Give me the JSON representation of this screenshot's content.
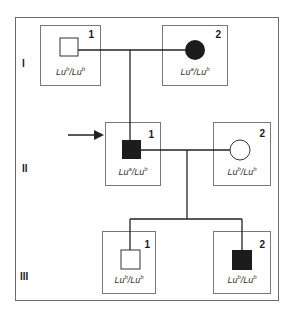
{
  "generations": [
    {
      "label": "I"
    },
    {
      "label": "II"
    },
    {
      "label": "III"
    }
  ],
  "individuals": {
    "I1": {
      "number": "1",
      "sex": "male",
      "affected": false,
      "genotype": {
        "a1": "Lu",
        "s1": "b",
        "a2": "Lu",
        "s2": "b"
      }
    },
    "I2": {
      "number": "2",
      "sex": "female",
      "affected": true,
      "genotype": {
        "a1": "Lu",
        "s1": "a",
        "a2": "Lu",
        "s2": "b"
      }
    },
    "II1": {
      "number": "1",
      "sex": "male",
      "affected": true,
      "proband": true,
      "genotype": {
        "a1": "Lu",
        "s1": "a",
        "a2": "Lu",
        "s2": "b"
      }
    },
    "II2": {
      "number": "2",
      "sex": "female",
      "affected": false,
      "genotype": {
        "a1": "Lu",
        "s1": "b",
        "a2": "Lu",
        "s2": "b"
      }
    },
    "III1": {
      "number": "1",
      "sex": "male",
      "affected": false,
      "genotype": {
        "a1": "Lu",
        "s1": "b",
        "a2": "Lu",
        "s2": "b"
      }
    },
    "III2": {
      "number": "2",
      "sex": "male",
      "affected": true,
      "genotype": {
        "a1": "Lu",
        "s1": "b",
        "a2": "Lu",
        "s2": "b"
      }
    }
  },
  "colors": {
    "affected": "#1c1c1c",
    "unaffected": "#ffffff",
    "line": "#222222"
  }
}
